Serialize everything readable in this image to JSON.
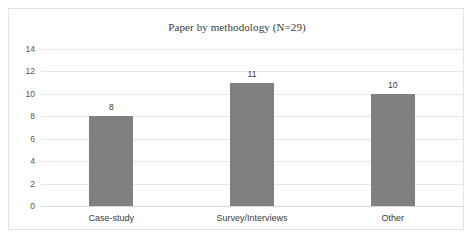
{
  "chart_data": {
    "type": "bar",
    "title": "Paper by methodology (N=29)",
    "categories": [
      "Case-study",
      "Survey/Interviews",
      "Other"
    ],
    "values": [
      8,
      11,
      10
    ],
    "data_labels": [
      "8",
      "11",
      "10"
    ],
    "xlabel": "",
    "ylabel": "",
    "ylim": [
      0,
      14
    ],
    "yticks": [
      0,
      2,
      4,
      6,
      8,
      10,
      12,
      14
    ],
    "ytick_labels": [
      "0",
      "2",
      "4",
      "6",
      "8",
      "10",
      "12",
      "14"
    ],
    "grid": true,
    "grid_axis": "y",
    "legend": false,
    "bar_color": "#808080",
    "gridline_color": "#e8e8e8",
    "border_color": "#e2e2e2",
    "title_color": "#3a3a3a",
    "label_color": "#3a3a3a",
    "tick_color": "#555555"
  }
}
